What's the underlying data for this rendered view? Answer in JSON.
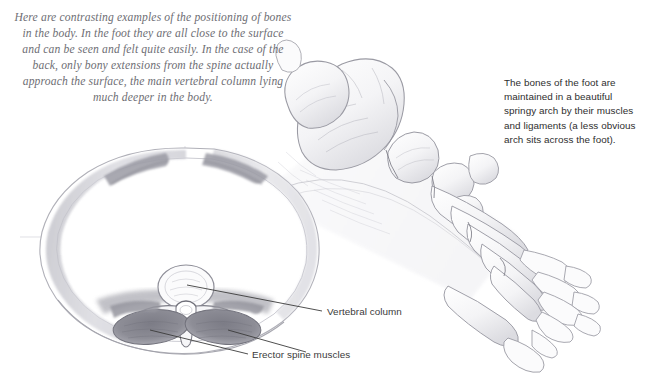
{
  "page": {
    "background_color": "#ffffff",
    "width": 648,
    "height": 391
  },
  "intro": {
    "text": "Here are contrasting examples of the positioning of bones in the body. In the foot they are all close to the surface and can be seen and felt quite easily. In the case of the back, only bony extensions from the spine actually approach the surface, the main vertebral column lying much deeper in the body.",
    "color": "#6e6e74",
    "style": "italic-serif-centered"
  },
  "foot_caption": {
    "text": "The bones of the foot are maintained in a beautiful springy arch by their muscles and ligaments (a less obvious arch sits across the foot).",
    "color": "#2e2e2e"
  },
  "labels": {
    "vertebral_column": "Vertebral column",
    "erector_spine_muscles": "Erector spine muscles"
  },
  "illustrations": {
    "torso_cross_section": {
      "name": "back-cross-section",
      "description": "Pencil drawing of a transverse cross-section through the torso showing the vertebral column deep inside and the erector spine muscles",
      "features": [
        "outer body wall contour",
        "construction crosshair lines",
        "vertebral body",
        "spinal canal",
        "transverse processes",
        "spinous process",
        "erector spine muscle masses",
        "shoulder-blade muscle shading"
      ]
    },
    "foot_skeleton": {
      "name": "foot-skeleton",
      "description": "Pencil drawing of the bones of the foot in side three-quarter view showing the springy longitudinal arch",
      "features": [
        "calcaneus",
        "talus",
        "navicular",
        "cuneiforms",
        "cuboid",
        "metatarsals",
        "phalanges"
      ]
    }
  },
  "colors": {
    "graphite_light": "#d8d8dc",
    "graphite_mid": "#a9a9b0",
    "graphite_dark": "#6d6d75",
    "muscle_dark": "#83838c",
    "leader_line": "#3b3b3b",
    "construction_line": "#d4d4da"
  }
}
